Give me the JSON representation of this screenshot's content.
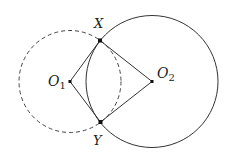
{
  "diagram": {
    "points": {
      "X": {
        "label": "X",
        "x": 100,
        "y": 40.5
      },
      "Y": {
        "label": "Y",
        "x": 100.5,
        "y": 122
      },
      "O1": {
        "label": "O",
        "sub": "1",
        "x": 70,
        "y": 81.5
      },
      "O2": {
        "label": "O",
        "sub": "2",
        "x": 152,
        "y": 81.5
      }
    },
    "circles": [
      {
        "name": "circle-O1",
        "cx": 70,
        "cy": 81.5,
        "r": 51,
        "style": "dashed"
      },
      {
        "name": "circle-O2",
        "cx": 152,
        "cy": 81.5,
        "r": 66,
        "style": "solid"
      }
    ],
    "segments": [
      "O1X",
      "O1Y",
      "O2X",
      "O2Y"
    ],
    "colors": {
      "stroke": "#333333",
      "background": "#ffffff"
    }
  }
}
